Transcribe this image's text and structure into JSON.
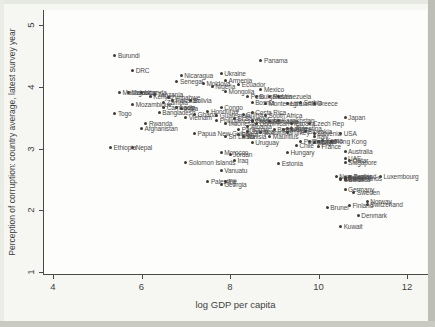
{
  "chart_data": {
    "type": "scatter",
    "title": "",
    "xlabel": "log GDP per capita",
    "ylabel": "Perception of corruption: country average, latest survey year",
    "xlim": [
      3.8,
      12.5
    ],
    "ylim": [
      0.95,
      5.25
    ],
    "xticks": [
      4,
      6,
      8,
      10,
      12
    ],
    "yticks": [
      1,
      2,
      3,
      4,
      5
    ],
    "grid": false,
    "legend": false,
    "marker_color": "#3b3b3b",
    "label_color": "#4c4c4c",
    "points_schema": [
      "label",
      "log_gdp_per_capita",
      "corruption_perception"
    ],
    "points": [
      [
        "Burundi",
        5.4,
        4.5
      ],
      [
        "DRC",
        5.8,
        4.27
      ],
      [
        "Panama",
        8.7,
        4.43
      ],
      [
        "Ukraine",
        7.8,
        4.22
      ],
      [
        "Nicaragua",
        6.9,
        4.19
      ],
      [
        "Armenia",
        7.9,
        4.1
      ],
      [
        "Senegal",
        6.8,
        4.08
      ],
      [
        "Moldova",
        7.4,
        4.05
      ],
      [
        "Ecuador",
        8.2,
        4.04
      ],
      [
        "Nigeria",
        7.6,
        4.0
      ],
      [
        "Mexico",
        8.7,
        3.96
      ],
      [
        "Mongolia",
        7.9,
        3.93
      ],
      [
        "Madagascar",
        5.5,
        3.91
      ],
      [
        "Malawi",
        5.7,
        3.9
      ],
      [
        "Uganda",
        6.0,
        3.91
      ],
      [
        "Tanzania",
        6.3,
        3.88
      ],
      [
        "Kenya",
        6.2,
        3.84
      ],
      [
        "Zimbabwe",
        6.6,
        3.83
      ],
      [
        "Peru",
        8.4,
        3.85
      ],
      [
        "Bulgaria",
        8.6,
        3.84
      ],
      [
        "Russia",
        8.9,
        3.84
      ],
      [
        "Venezuela",
        9.1,
        3.84
      ],
      [
        "Pakistan",
        6.7,
        3.77
      ],
      [
        "Bolivia",
        7.1,
        3.77
      ],
      [
        "Zambia",
        6.5,
        3.74
      ],
      [
        "Bosnia",
        8.5,
        3.74
      ],
      [
        "Montenegro",
        8.8,
        3.73
      ],
      [
        "Lithuania",
        9.3,
        3.73
      ],
      [
        "Serbia",
        9.6,
        3.74
      ],
      [
        "Greece",
        9.9,
        3.73
      ],
      [
        "Mozambique",
        5.8,
        3.72
      ],
      [
        "Cambodia",
        6.5,
        3.66
      ],
      [
        "Laos",
        6.8,
        3.67
      ],
      [
        "India",
        6.9,
        3.65
      ],
      [
        "Congo",
        7.8,
        3.66
      ],
      [
        "Bangladesh",
        6.4,
        3.59
      ],
      [
        "Honduras",
        7.5,
        3.6
      ],
      [
        "Costa Rica",
        8.5,
        3.59
      ],
      [
        "Togo",
        5.4,
        3.57
      ],
      [
        "Ghana",
        7.2,
        3.55
      ],
      [
        "China",
        8.3,
        3.55
      ],
      [
        "Guatemala",
        7.7,
        3.54
      ],
      [
        "South Africa",
        8.8,
        3.54
      ],
      [
        "Japan",
        10.6,
        3.51
      ],
      [
        "Vietnam",
        7.0,
        3.5
      ],
      [
        "El Salvador",
        8.1,
        3.49
      ],
      [
        "Colombia",
        8.5,
        3.46
      ],
      [
        "Philippines",
        7.7,
        3.45
      ],
      [
        "Kazakhstan",
        9.1,
        3.45
      ],
      [
        "Thailand",
        8.5,
        3.44
      ],
      [
        "Romania",
        8.9,
        3.43
      ],
      [
        "Czech Rep",
        9.8,
        3.41
      ],
      [
        "Rwanda",
        6.1,
        3.4
      ],
      [
        "Indonesia",
        7.9,
        3.4
      ],
      [
        "Dominican Rep",
        8.6,
        3.4
      ],
      [
        "Croatia",
        9.4,
        3.4
      ],
      [
        "Albania",
        8.4,
        3.35
      ],
      [
        "Latvia",
        9.3,
        3.33
      ],
      [
        "Argentina",
        9.4,
        3.33
      ],
      [
        "Afghanistan",
        6.0,
        3.32
      ],
      [
        "Paraguay",
        8.2,
        3.3
      ],
      [
        "Brazil",
        9.0,
        3.3
      ],
      [
        "Malaysia",
        9.2,
        3.3
      ],
      [
        "Jamaica",
        8.4,
        3.28
      ],
      [
        "Slovakia",
        9.7,
        3.28
      ],
      [
        "Botswana",
        8.7,
        3.26
      ],
      [
        "Turkey",
        9.3,
        3.26
      ],
      [
        "Papua New Guinea",
        7.2,
        3.25
      ],
      [
        "Slovenia",
        9.9,
        3.25
      ],
      [
        "USA",
        10.5,
        3.25
      ],
      [
        "Egypt",
        8.2,
        3.23
      ],
      [
        "Tunisia",
        8.3,
        3.2
      ],
      [
        "Mauritius",
        8.9,
        3.2
      ],
      [
        "Sri Lanka",
        7.9,
        3.19
      ],
      [
        "Italy",
        9.9,
        3.19
      ],
      [
        "Korea",
        10.1,
        3.13
      ],
      [
        "Poland",
        9.6,
        3.12
      ],
      [
        "Portugal",
        9.8,
        3.12
      ],
      [
        "Israel",
        10.0,
        3.12
      ],
      [
        "Hong Kong",
        10.3,
        3.12
      ],
      [
        "Uruguay",
        8.5,
        3.1
      ],
      [
        "Spain",
        9.9,
        3.09
      ],
      [
        "Chile",
        9.5,
        3.05
      ],
      [
        "France",
        10.0,
        3.03
      ],
      [
        "Nepal",
        5.8,
        3.02
      ],
      [
        "Ethiopia",
        5.3,
        3.01
      ],
      [
        "Australia",
        10.6,
        2.95
      ],
      [
        "Hungary",
        9.3,
        2.93
      ],
      [
        "Morocco",
        7.8,
        2.93
      ],
      [
        "Jordan",
        8.0,
        2.9
      ],
      [
        "UAE",
        10.6,
        2.83
      ],
      [
        "Iraq",
        8.1,
        2.8
      ],
      [
        "Qatar",
        10.7,
        2.8
      ],
      [
        "Singapore",
        10.6,
        2.78
      ],
      [
        "Solomon Islands",
        7.0,
        2.78
      ],
      [
        "Estonia",
        9.1,
        2.76
      ],
      [
        "Vanuatu",
        7.8,
        2.65
      ],
      [
        "Austria",
        10.7,
        2.55
      ],
      [
        "New Zealand",
        10.4,
        2.54
      ],
      [
        "Luxembourg",
        11.4,
        2.54
      ],
      [
        "Belgium",
        10.6,
        2.53
      ],
      [
        "Iceland",
        10.5,
        2.52
      ],
      [
        "Netherlands",
        10.6,
        2.52
      ],
      [
        "UK",
        10.5,
        2.5
      ],
      [
        "Canada",
        10.6,
        2.49
      ],
      [
        "Palestine",
        7.5,
        2.47
      ],
      [
        "Fiji",
        7.9,
        2.47
      ],
      [
        "Georgia",
        7.8,
        2.42
      ],
      [
        "Germany",
        10.6,
        2.34
      ],
      [
        "Sweden",
        10.8,
        2.29
      ],
      [
        "Norway",
        11.1,
        2.14
      ],
      [
        "Switzerland",
        11.1,
        2.1
      ],
      [
        "Finland",
        10.7,
        2.07
      ],
      [
        "Brunei",
        10.2,
        2.04
      ],
      [
        "Denmark",
        10.9,
        1.91
      ],
      [
        "Kuwait",
        10.5,
        1.74
      ]
    ]
  }
}
